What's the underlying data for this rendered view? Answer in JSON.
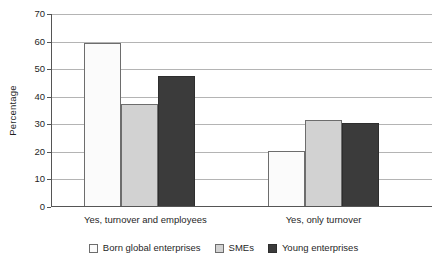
{
  "chart_data": {
    "type": "bar",
    "title": "",
    "xlabel": "",
    "ylabel": "Percentage",
    "ylim": [
      0,
      70
    ],
    "yticks": [
      0,
      10,
      20,
      30,
      40,
      50,
      60,
      70
    ],
    "ytick_labels": [
      "0",
      "10",
      "20",
      "30",
      "40",
      "50",
      "60",
      "70"
    ],
    "grid": true,
    "legend_position": "bottom",
    "categories": [
      "Yes, turnover and employees",
      "Yes, only turnover"
    ],
    "series": [
      {
        "name": "Born global enterprises",
        "color": "#fbfbfb",
        "edge_color": "#6d6d6d",
        "values": [
          59.5,
          20.2
        ]
      },
      {
        "name": "SMEs",
        "color": "#d2d2d2",
        "edge_color": "#6d6d6d",
        "values": [
          37.4,
          31.4
        ]
      },
      {
        "name": "Young enterprises",
        "color": "#3b3b3b",
        "edge_color": "#2e2e2e",
        "values": [
          47.4,
          30.6
        ]
      }
    ]
  },
  "axis": {
    "y_title": "Percentage"
  },
  "legend": {
    "items": [
      {
        "label": "Born global enterprises"
      },
      {
        "label": "SMEs"
      },
      {
        "label": "Young enterprises"
      }
    ]
  },
  "colors": {
    "gridline": "#b4b4b4",
    "axis": "#555555",
    "text": "#1f1f1f",
    "background": "#ffffff"
  }
}
